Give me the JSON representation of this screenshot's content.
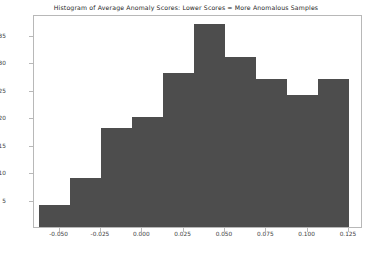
{
  "chart_data": {
    "type": "bar",
    "title": "Histogram of Average Anomaly Scores: Lower Scores = More Anomalous Samples",
    "xlabel": "",
    "ylabel": "",
    "bin_edges": [
      -0.0625,
      -0.0437,
      -0.025,
      -0.0062,
      0.0125,
      0.0312,
      0.05,
      0.0687,
      0.0875,
      0.1062,
      0.125
    ],
    "categories": [
      "-0.0625 to -0.0437",
      "-0.0437 to -0.025",
      "-0.025 to -0.0062",
      "-0.0062 to 0.0125",
      "0.0125 to 0.05",
      "0.05 to 0.0687",
      "0.0687 to 0.0875",
      "0.0875 to 0.1062",
      "0.1062 to 0.1125",
      "0.1125 to 0.125"
    ],
    "values": [
      4,
      9,
      18,
      20,
      28,
      37,
      31,
      27,
      24,
      27
    ],
    "xlim": [
      -0.0655,
      0.1335
    ],
    "ylim": [
      0,
      38.8
    ],
    "xticks": [
      -0.05,
      -0.025,
      0.0,
      0.025,
      0.05,
      0.075,
      0.1,
      0.125
    ],
    "xtick_labels": [
      "-0.050",
      "-0.025",
      "0.000",
      "0.025",
      "0.050",
      "0.075",
      "0.100",
      "0.125"
    ],
    "yticks": [
      5,
      10,
      15,
      20,
      25,
      30,
      35
    ],
    "ytick_labels": [
      "5",
      "10",
      "15",
      "20",
      "25",
      "30",
      "35"
    ],
    "grid": false,
    "legend": null,
    "bar_color": "#4d4d4d",
    "frame_color": "#b8b8b8",
    "background": "#ffffff"
  }
}
